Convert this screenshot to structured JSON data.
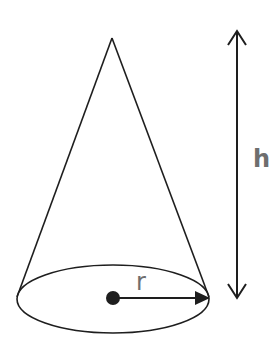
{
  "diagram": {
    "labels": {
      "radius": "r",
      "height": "h"
    },
    "colors": {
      "stroke": "#1e1e1e",
      "label": "#6e6e6e",
      "background": "#ffffff"
    }
  }
}
